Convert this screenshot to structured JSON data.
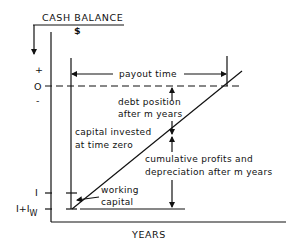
{
  "diagram": {
    "y_axis_label": "CASH BALANCE",
    "y_axis_unit": "$",
    "x_axis_label": "YEARS",
    "y_ticks": {
      "plus": "+",
      "zero": "O",
      "minus": "-",
      "investment": "I",
      "investment_plus_working": "I+I",
      "working_subscript": "W"
    },
    "annotations": {
      "payout_time": "payout time",
      "debt_position_line1": "debt position",
      "debt_position_line2": "after m years",
      "capital_invested_line1": "capital invested",
      "capital_invested_line2": "at time zero",
      "cumulative_line1": "cumulative profits and",
      "cumulative_line2": "depreciation after m years",
      "working_capital_line1": "working",
      "working_capital_line2": "capital"
    },
    "colors": {
      "ink": "#111111",
      "background": "#ffffff"
    }
  }
}
